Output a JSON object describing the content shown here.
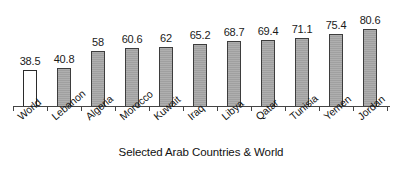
{
  "chart_data": {
    "type": "bar",
    "title": "",
    "subtitle": "",
    "xlabel": "Selected Arab Countries & World",
    "ylabel": "",
    "ylim": [
      0,
      88
    ],
    "grid": false,
    "legend": "none",
    "categories": [
      "World",
      "Lebanon",
      "Algeria",
      "Morocco",
      "Kuwait",
      "Iraq",
      "Libya",
      "Qatar",
      "Tunisia",
      "Yemen",
      "Jordan"
    ],
    "values": [
      38.5,
      40.8,
      58,
      60.6,
      62,
      65.2,
      68.7,
      69.4,
      71.1,
      75.4,
      80.6
    ],
    "value_labels": [
      "38.5",
      "40.8",
      "58",
      "60.6",
      "62",
      "65.2",
      "68.7",
      "69.4",
      "71.1",
      "75.4",
      "80.6"
    ],
    "bar_styles": [
      "unfilled",
      "filled",
      "filled",
      "filled",
      "filled",
      "filled",
      "filled",
      "filled",
      "filled",
      "filled",
      "filled"
    ],
    "colors": {
      "bar_fill": "#a0a0a0",
      "bar_border": "#3d3d3d",
      "highlight_fill": "#ffffff",
      "axis": "#444444",
      "text": "#111111"
    }
  }
}
